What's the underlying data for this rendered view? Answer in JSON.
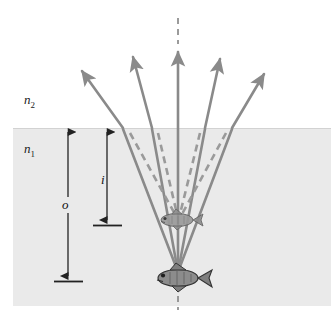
{
  "figure": {
    "type": "optics-ray-diagram"
  },
  "labels": {
    "upper_medium": "n",
    "upper_medium_sub": "2",
    "lower_medium": "n",
    "lower_medium_sub": "1",
    "object_distance": "o",
    "image_distance": "i"
  },
  "colors": {
    "water_fill": "#eaeaea",
    "air_fill": "#ffffff",
    "ray": "#8a8a8a",
    "dashed_ray": "#9a9a9a",
    "axis_dash": "#8a8a8a",
    "dimension_arrow": "#222222",
    "text": "#111111",
    "fish_body": "#777777",
    "fish_outline": "#3a3a3a"
  },
  "geometry": {
    "surface_y": 128,
    "water_left": 13,
    "water_right": 331,
    "water_bottom": 306,
    "object_fish": {
      "x": 178,
      "y": 278
    },
    "image_fish": {
      "x": 178,
      "y": 221
    },
    "convergence_point": {
      "x": 178,
      "y": 272
    },
    "virtual_convergence_point": {
      "x": 178,
      "y": 215
    },
    "optical_axis_x": 178
  },
  "rays": [
    {
      "name": "ray-far-left",
      "surface_x": 123,
      "tip_x": 80,
      "tip_y": 68
    },
    {
      "name": "ray-left",
      "surface_x": 152,
      "tip_x": 131,
      "tip_y": 53
    },
    {
      "name": "ray-center",
      "surface_x": 178,
      "tip_x": 178,
      "tip_y": 48
    },
    {
      "name": "ray-right",
      "surface_x": 205,
      "tip_x": 222,
      "tip_y": 55
    },
    {
      "name": "ray-far-right",
      "surface_x": 232,
      "tip_x": 267,
      "tip_y": 70
    }
  ],
  "dimensions": {
    "object_arrow": {
      "x": 68,
      "top_y": 130,
      "bottom_y": 278
    },
    "image_arrow": {
      "x": 107,
      "top_y": 130,
      "bottom_y": 222
    }
  }
}
